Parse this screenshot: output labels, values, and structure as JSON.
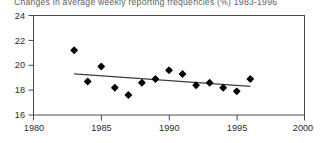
{
  "chart_data": {
    "type": "scatter",
    "title": "Changes in average weekly reporting frequencies (%) 1983-1996",
    "xlabel": "",
    "ylabel": "",
    "xlim": [
      1980,
      2000
    ],
    "ylim": [
      16,
      24
    ],
    "xticks": [
      1980,
      1985,
      1990,
      1995,
      2000
    ],
    "yticks": [
      16,
      18,
      20,
      22,
      24
    ],
    "xtick_labels": [
      "1980",
      "1985",
      "1990",
      "1995",
      "2000"
    ],
    "ytick_labels": [
      "16",
      "18",
      "20",
      "22",
      "24"
    ],
    "grid": false,
    "legend": null,
    "series": [
      {
        "name": "Average weekly reporting frequency",
        "marker": "diamond",
        "color": "#000000",
        "x": [
          1983,
          1984,
          1985,
          1986,
          1987,
          1988,
          1989,
          1990,
          1991,
          1992,
          1993,
          1994,
          1995,
          1996
        ],
        "values": [
          21.2,
          18.7,
          19.9,
          18.2,
          17.6,
          18.6,
          18.9,
          19.6,
          19.3,
          18.4,
          18.6,
          18.2,
          17.9,
          18.9
        ]
      },
      {
        "name": "Linear trend",
        "type": "line",
        "color": "#3d3d3d",
        "x": [
          1983,
          1996
        ],
        "values": [
          19.3,
          18.3
        ]
      }
    ]
  }
}
